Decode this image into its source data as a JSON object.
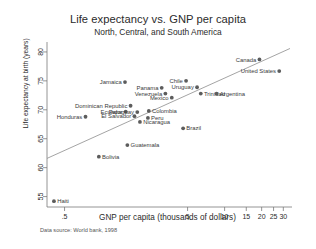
{
  "chart_data": {
    "type": "scatter",
    "title": "Life expectancy vs. GNP per capita",
    "subtitle": "North, Central, and South America",
    "xlabel": "GNP per capita (thousands of dollars)",
    "ylabel": "Life expectancy at birth (years)",
    "source_note": "Data source:  World bank, 1998",
    "xscale": "log",
    "yscale": "linear",
    "xlim": [
      0.36,
      34
    ],
    "ylim": [
      53.2,
      81.2
    ],
    "xticks": [
      0.5,
      5,
      10,
      15,
      20,
      25,
      30
    ],
    "xticklabels": [
      ".5",
      "5",
      "10",
      "15",
      "20",
      "25",
      "30"
    ],
    "yticks": [
      55,
      60,
      65,
      70,
      75,
      80
    ],
    "yticklabels": [
      "55",
      "60",
      "65",
      "70",
      "75",
      "80"
    ],
    "grid": false,
    "legend": "none",
    "marker_color": "#5c5c5c",
    "line_color": "#8d8d8d",
    "fit_line": {
      "label": "linear fit (log x)",
      "x0": 0.36,
      "y0": 61.6,
      "x1": 34.0,
      "y1": 80.6
    },
    "points": [
      {
        "name": "Haiti",
        "x": 0.41,
        "y": 54.2,
        "label_side": "right"
      },
      {
        "name": "Honduras",
        "x": 0.74,
        "y": 68.8,
        "label_side": "left"
      },
      {
        "name": "Bolivia",
        "x": 0.95,
        "y": 61.9,
        "label_side": "right"
      },
      {
        "name": "Dominican Republic",
        "x": 1.72,
        "y": 70.7,
        "label_side": "left"
      },
      {
        "name": "Ecuador",
        "x": 1.57,
        "y": 69.7,
        "label_side": "left"
      },
      {
        "name": "El Salvador",
        "x": 1.85,
        "y": 68.9,
        "label_side": "left"
      },
      {
        "name": "Jamaica",
        "x": 1.55,
        "y": 74.8,
        "label_side": "left"
      },
      {
        "name": "Guatemala",
        "x": 1.62,
        "y": 63.9,
        "label_side": "right"
      },
      {
        "name": "Paraguay",
        "x": 1.95,
        "y": 69.6,
        "label_side": "left"
      },
      {
        "name": "Panama",
        "x": 3.08,
        "y": 73.8,
        "label_side": "left"
      },
      {
        "name": "Colombia",
        "x": 2.42,
        "y": 69.8,
        "label_side": "right"
      },
      {
        "name": "Peru",
        "x": 2.38,
        "y": 68.6,
        "label_side": "right"
      },
      {
        "name": "Nicaragua",
        "x": 2.05,
        "y": 67.9,
        "label_side": "right"
      },
      {
        "name": "Venezuela",
        "x": 3.3,
        "y": 72.8,
        "label_side": "left"
      },
      {
        "name": "Mexico",
        "x": 3.72,
        "y": 72.1,
        "label_side": "left"
      },
      {
        "name": "Chile",
        "x": 4.86,
        "y": 75.0,
        "label_side": "left"
      },
      {
        "name": "Uruguay",
        "x": 5.97,
        "y": 73.9,
        "label_side": "left"
      },
      {
        "name": "Trinidad",
        "x": 6.4,
        "y": 72.8,
        "label_side": "right"
      },
      {
        "name": "Argentina",
        "x": 8.6,
        "y": 72.8,
        "label_side": "right"
      },
      {
        "name": "Brazil",
        "x": 4.6,
        "y": 66.8,
        "label_side": "right"
      },
      {
        "name": "Canada",
        "x": 19.2,
        "y": 78.7,
        "label_side": "left"
      },
      {
        "name": "United States",
        "x": 27.8,
        "y": 76.7,
        "label_side": "left"
      }
    ]
  }
}
